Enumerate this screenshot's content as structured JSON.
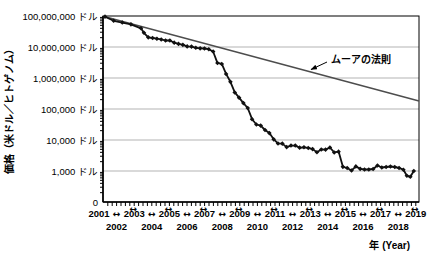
{
  "chart_data": {
    "type": "line",
    "title": "",
    "xlabel": "年 (Year)",
    "ylabel": "価格（米ドル／ヒトゲノム）",
    "y_scale": "log",
    "grid": "horizontal",
    "x_range": [
      2001,
      2019.9
    ],
    "y_axis": {
      "ticks": [
        {
          "label": "100,000,000 ドル",
          "value": 100000000
        },
        {
          "label": "10,000,000 ドル",
          "value": 10000000
        },
        {
          "label": "1,000,000 ドル",
          "value": 1000000
        },
        {
          "label": "100,000 ドル",
          "value": 100000
        },
        {
          "label": "10,000 ドル",
          "value": 10000
        },
        {
          "label": "1,000 ドル",
          "value": 1000
        },
        {
          "label": "0",
          "value": 0
        }
      ]
    },
    "x_axis": {
      "years_row1": [
        2001,
        2003,
        2005,
        2007,
        2009,
        2011,
        2013,
        2015,
        2017,
        2019
      ],
      "years_row2": [
        2002,
        2004,
        2006,
        2008,
        2010,
        2012,
        2014,
        2016,
        2018
      ],
      "span_arrow_glyph": "↔",
      "minor_tick_interval_years": 0.25
    },
    "annotation": {
      "label": "ムーアの法則"
    },
    "moore_line": {
      "points": [
        [
          2001.75,
          95263072
        ],
        [
          2019.9,
          180000
        ]
      ],
      "color": "#4d4d4d"
    },
    "series": [
      {
        "id": "cost-per-genome",
        "color": "#111111",
        "marker": "diamond",
        "points": [
          [
            2001.75,
            95263072
          ],
          [
            2002.25,
            70175437
          ],
          [
            2002.75,
            61448422
          ],
          [
            2003.25,
            53751684
          ],
          [
            2003.83,
            40157554
          ],
          [
            2004.0,
            28780376
          ],
          [
            2004.25,
            20442576
          ],
          [
            2004.5,
            19550993
          ],
          [
            2004.75,
            18519312
          ],
          [
            2005.0,
            17534970
          ],
          [
            2005.25,
            16159699
          ],
          [
            2005.5,
            16180224
          ],
          [
            2005.75,
            13801124
          ],
          [
            2006.0,
            12585659
          ],
          [
            2006.25,
            11732535
          ],
          [
            2006.5,
            10474556
          ],
          [
            2006.75,
            10314621
          ],
          [
            2007.0,
            9408739
          ],
          [
            2007.25,
            9047003
          ],
          [
            2007.5,
            8927342
          ],
          [
            2007.75,
            8500000
          ],
          [
            2008.0,
            7147571
          ],
          [
            2008.25,
            3063820
          ],
          [
            2008.5,
            2842101
          ],
          [
            2008.75,
            1352982
          ],
          [
            2009.0,
            752080
          ],
          [
            2009.25,
            342502
          ],
          [
            2009.5,
            232735
          ],
          [
            2009.75,
            154714
          ],
          [
            2010.0,
            108065
          ],
          [
            2010.25,
            46774
          ],
          [
            2010.5,
            31512
          ],
          [
            2010.75,
            29092
          ],
          [
            2011.0,
            20963
          ],
          [
            2011.25,
            16712
          ],
          [
            2011.5,
            10497
          ],
          [
            2011.75,
            7743
          ],
          [
            2012.0,
            7666
          ],
          [
            2012.25,
            5901
          ],
          [
            2012.5,
            6618
          ],
          [
            2012.75,
            6618
          ],
          [
            2013.0,
            5671
          ],
          [
            2013.25,
            5826
          ],
          [
            2013.5,
            5550
          ],
          [
            2013.75,
            5096
          ],
          [
            2014.0,
            4008
          ],
          [
            2014.25,
            4920
          ],
          [
            2014.5,
            4905
          ],
          [
            2014.75,
            5731
          ],
          [
            2015.0,
            3970
          ],
          [
            2015.25,
            4211
          ],
          [
            2015.5,
            1363
          ],
          [
            2015.75,
            1245
          ],
          [
            2016.0,
            1037
          ],
          [
            2016.25,
            1407
          ],
          [
            2016.5,
            1172
          ],
          [
            2016.75,
            1121
          ],
          [
            2017.0,
            1121
          ],
          [
            2017.25,
            1158
          ],
          [
            2017.5,
            1500
          ],
          [
            2017.75,
            1300
          ],
          [
            2018.0,
            1350
          ],
          [
            2018.25,
            1400
          ],
          [
            2018.5,
            1350
          ],
          [
            2018.75,
            1250
          ],
          [
            2019.0,
            1100
          ],
          [
            2019.2,
            700
          ],
          [
            2019.4,
            650
          ],
          [
            2019.6,
            1000
          ]
        ]
      }
    ],
    "colors": {
      "grid": "#b3b3b3",
      "axis": "#000000",
      "data_line": "#111111",
      "moore_line": "#4d4d4d",
      "text": "#000000"
    }
  }
}
